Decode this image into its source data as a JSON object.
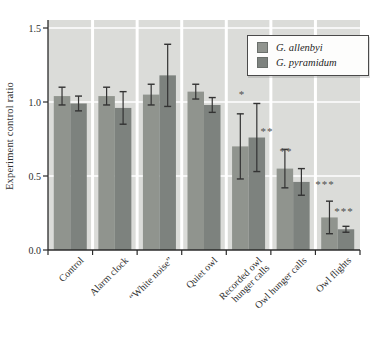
{
  "figure": {
    "ylabel": "Experiment control ratio"
  },
  "legend": {
    "items": [
      {
        "label": "G. allenbyi",
        "color": "#90948e"
      },
      {
        "label": "G. pyramidum",
        "color": "#7d827e"
      }
    ]
  },
  "chart_data": {
    "type": "bar",
    "title": "",
    "xlabel": "",
    "ylabel": "Experiment control ratio",
    "ylim": [
      0,
      1.5
    ],
    "yticks": [
      0.0,
      0.5,
      1.0,
      1.5
    ],
    "ytick_labels": [
      "0.0",
      "0.5",
      "1.0",
      "1.5"
    ],
    "grid": "horizontal white gridlines on light gray panel, white vertical separators between categories",
    "legend_position": "upper right",
    "categories": [
      "Control",
      "Alarm clock",
      "“White noise”",
      "Quiet owl",
      "Recorded owl\nhunger calls",
      "Owl hunger calls",
      "Owl flights"
    ],
    "series": [
      {
        "name": "G. allenbyi",
        "color": "#90948e",
        "values": [
          1.04,
          1.04,
          1.05,
          1.07,
          0.7,
          0.55,
          0.22
        ],
        "errors": [
          0.06,
          0.06,
          0.07,
          0.05,
          0.22,
          0.13,
          0.11
        ]
      },
      {
        "name": "G. pyramidum",
        "color": "#7d827e",
        "values": [
          0.99,
          0.96,
          1.18,
          0.98,
          0.76,
          0.46,
          0.14
        ],
        "errors": [
          0.05,
          0.11,
          0.21,
          0.05,
          0.23,
          0.09,
          0.02
        ]
      }
    ],
    "annotations": [
      {
        "text": "*",
        "category": "Recorded owl hunger calls",
        "series": "G. allenbyi",
        "x_px": 242,
        "y_value": 1.05
      },
      {
        "text": "**",
        "category": "Owl hunger calls",
        "series": "G. allenbyi",
        "x_px": 267,
        "y_value": 0.8
      },
      {
        "text": "**",
        "category": "Owl hunger calls",
        "series": "G. pyramidum",
        "x_px": 286,
        "y_value": 0.66
      },
      {
        "text": "***",
        "category": "Owl flights",
        "series": "G. allenbyi",
        "x_px": 325,
        "y_value": 0.44
      },
      {
        "text": "***",
        "category": "Owl flights",
        "series": "G. pyramidum",
        "x_px": 344,
        "y_value": 0.255
      }
    ],
    "colors": {
      "panel_bg": "#dbdcd9",
      "gridline": "#ffffff",
      "axis": "#2b2b2b",
      "error_bar": "#333333",
      "text": "#2e2e2e",
      "annotation": "#4f4f4f"
    }
  }
}
